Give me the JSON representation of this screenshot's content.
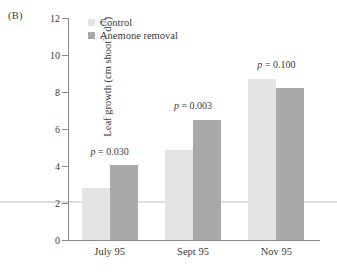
{
  "panel": {
    "label": "(B)"
  },
  "legend": {
    "position": "top-left-inside",
    "items": [
      {
        "label": "Control",
        "color": "#e3e3e3",
        "swatch_name": "legend-swatch-control"
      },
      {
        "label": "Anemone removal",
        "color": "#a9a9a9",
        "swatch_name": "legend-swatch-removal"
      }
    ]
  },
  "chart_data": {
    "type": "bar",
    "title": "",
    "subtitle": "",
    "xlabel": "",
    "ylabel_parts": {
      "main": "Leaf growth (cm shoot",
      "sup1": "-1",
      "mid": " d",
      "sup2": "-1",
      "tail": ")"
    },
    "ylabel": "Leaf growth (cm shoot-1 d-1)",
    "categories": [
      "July 95",
      "Sept 95",
      "Nov 95"
    ],
    "series": [
      {
        "name": "Control",
        "color": "#e3e3e3",
        "values": [
          2.8,
          4.85,
          8.7
        ]
      },
      {
        "name": "Anemone removal",
        "color": "#a9a9a9",
        "values": [
          4.05,
          6.5,
          8.2
        ]
      }
    ],
    "ylim": [
      0,
      12
    ],
    "yticks": [
      0,
      2,
      4,
      6,
      8,
      10,
      12
    ],
    "ytick_labels": [
      "0",
      "2",
      "4",
      "6",
      "8",
      "10",
      "12"
    ],
    "grid": false,
    "annotations": [
      {
        "text": "p = 0.030",
        "p_symbol": "p",
        "equals_value": " = 0.030",
        "category": "July 95",
        "y": 4.72
      },
      {
        "text": "p = 0.003",
        "p_symbol": "p",
        "equals_value": " = 0.003",
        "category": "Sept 95",
        "y": 7.18
      },
      {
        "text": "p = 0.100",
        "p_symbol": "p",
        "equals_value": " = 0.100",
        "category": "Nov 95",
        "y": 9.42
      }
    ]
  },
  "colors": {
    "control": "#e3e3e3",
    "removal": "#a9a9a9",
    "axis": "#8a8a8a",
    "text": "#3a3a3a",
    "artifact_line": "#d8d8d8"
  }
}
